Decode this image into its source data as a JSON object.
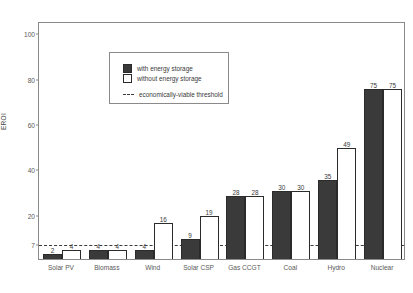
{
  "chart_data": {
    "type": "bar",
    "title": "",
    "xlabel": "",
    "ylabel": "EROI",
    "ylim": [
      0,
      105
    ],
    "grid": false,
    "legend_position": "upper-left-inside",
    "categories": [
      "Solar PV",
      "Biomass",
      "Wind",
      "Solar CSP",
      "Gas CCGT",
      "Coal",
      "Hydro",
      "Nuclear"
    ],
    "series": [
      {
        "name": "with energy storage",
        "values": [
          2,
          4,
          4,
          9,
          28,
          30,
          35,
          75
        ]
      },
      {
        "name": "without energy storage",
        "values": [
          4,
          4,
          16,
          19,
          28,
          30,
          49,
          75
        ]
      }
    ],
    "y_ticks": [
      {
        "value": 100,
        "label": "100"
      },
      {
        "value": 80,
        "label": "80"
      },
      {
        "value": 60,
        "label": "60"
      },
      {
        "value": 40,
        "label": "40"
      },
      {
        "value": 20,
        "label": "20"
      },
      {
        "value": 7,
        "label": "7"
      }
    ],
    "threshold": {
      "value": 7,
      "label": "economically-viable threshold",
      "style": "dashed"
    },
    "colors": {
      "with_storage": "#3a3a3a",
      "without_storage": "#ffffff",
      "bar_outline": "#2b2b2b",
      "threshold_line": "#3a3a3a",
      "axis": "#8a8a8a",
      "text": "#5a5a5a"
    }
  },
  "legend": {
    "items": [
      {
        "label": "with energy storage",
        "swatch": "dark"
      },
      {
        "label": "without energy storage",
        "swatch": "light"
      },
      {
        "label": "economically-viable threshold",
        "swatch": "dash"
      }
    ]
  }
}
